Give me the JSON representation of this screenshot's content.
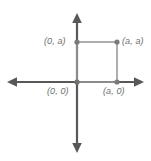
{
  "figure": {
    "kind": "coordinate-plane-square-diagram",
    "width": 151,
    "height": 161,
    "background_color": "#ffffff",
    "axis_color": "#58585a",
    "square_edge_color": "#9a9a9a",
    "vertex_dot_color": "#7a7a7a",
    "label_color": "#6e6e6e",
    "origin_px": {
      "x": 77,
      "y": 82
    },
    "axes": {
      "x_axis": {
        "x1": 8,
        "y1": 82,
        "x2": 143,
        "y2": 82,
        "arrow_left": true,
        "arrow_right": true
      },
      "y_axis": {
        "x1": 77,
        "y1": 14,
        "x2": 77,
        "y2": 152,
        "arrow_up": true,
        "arrow_down": true
      }
    },
    "square": {
      "x": 77,
      "y": 42,
      "width": 40,
      "height": 40,
      "filled": false
    },
    "vertices": [
      {
        "name": "origin",
        "label": "(0, 0)",
        "px": {
          "x": 77,
          "y": 82
        }
      },
      {
        "name": "x-vertex",
        "label": "(a, 0)",
        "px": {
          "x": 117,
          "y": 82
        }
      },
      {
        "name": "xy-vertex",
        "label": "(a, a)",
        "px": {
          "x": 117,
          "y": 42
        }
      },
      {
        "name": "y-vertex",
        "label": "(0, a)",
        "px": {
          "x": 77,
          "y": 42
        }
      }
    ],
    "labels": {
      "top_left": "(0, a)",
      "top_right": "(a, a)",
      "bottom_left": "(0, 0)",
      "bottom_right": "(a, 0)"
    }
  }
}
